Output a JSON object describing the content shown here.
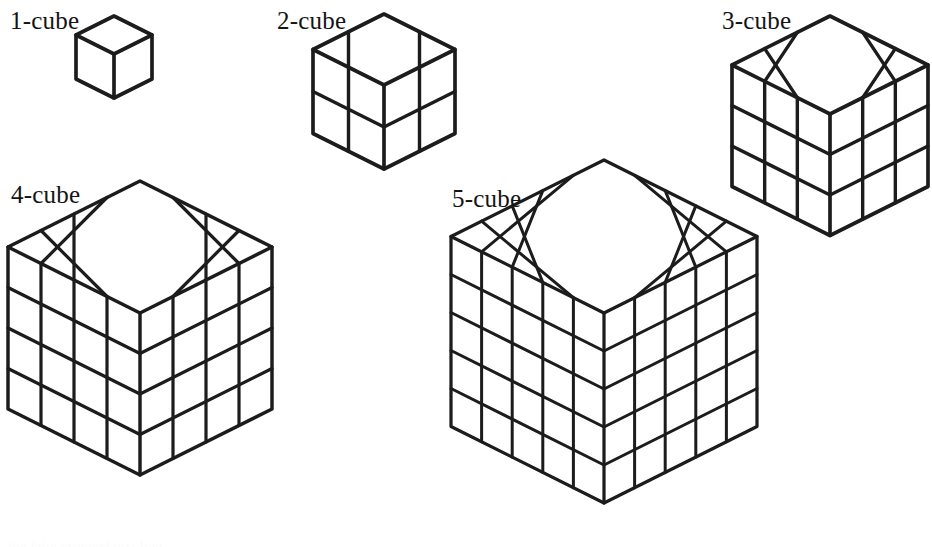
{
  "figure": {
    "background_color": "#ffffff",
    "stroke_color": "#1c1c1c",
    "face_color": "#ffffff",
    "width": 932,
    "height": 544,
    "cubes": [
      {
        "id": "cube-1",
        "label": "1-cube",
        "n": 1,
        "unit_cubes": 1,
        "label_x": 10,
        "label_y": 8,
        "center_x": 114,
        "top_y": 16,
        "half_width": 38,
        "side_height": 44,
        "stroke_width": 3.4
      },
      {
        "id": "cube-2",
        "label": "2-cube",
        "n": 2,
        "unit_cubes": 8,
        "label_x": 277,
        "label_y": 8,
        "center_x": 384,
        "top_y": 14,
        "half_width": 71,
        "side_height": 42,
        "stroke_width": 3.4
      },
      {
        "id": "cube-3",
        "label": "3-cube",
        "n": 3,
        "unit_cubes": 27,
        "label_x": 722,
        "label_y": 8,
        "center_x": 830,
        "top_y": 16,
        "half_width": 98,
        "side_height": 40.5,
        "stroke_width": 3.4
      },
      {
        "id": "cube-4",
        "label": "4-cube",
        "n": 4,
        "unit_cubes": 64,
        "label_x": 11,
        "label_y": 182,
        "center_x": 140,
        "top_y": 181,
        "half_width": 132,
        "side_height": 40.5,
        "stroke_width": 3.2
      },
      {
        "id": "cube-5",
        "label": "5-cube",
        "n": 5,
        "unit_cubes": 125,
        "label_x": 452,
        "label_y": 186,
        "center_x": 604,
        "top_y": 160,
        "half_width": 153,
        "side_height": 38,
        "stroke_width": 3.0
      }
    ],
    "bottom_fragment_text": "the faint cropped text line"
  }
}
